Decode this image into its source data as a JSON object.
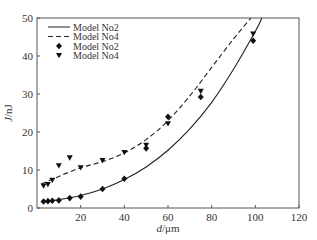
{
  "chart_data": {
    "type": "line",
    "title": "",
    "xlabel": "d/μm",
    "ylabel": "J/nJ",
    "xlim": [
      0,
      120
    ],
    "ylim": [
      0,
      50
    ],
    "xticks": [
      20,
      40,
      60,
      80,
      100,
      120
    ],
    "yticks": [
      0,
      10,
      20,
      30,
      40,
      50
    ],
    "grid": false,
    "legend_position": "upper left",
    "legend": [
      {
        "label": "Model No2",
        "style": "solid-line"
      },
      {
        "label": "Model No4",
        "style": "dashed-line"
      },
      {
        "label": "Model No2",
        "style": "diamond-marker"
      },
      {
        "label": "Model No4",
        "style": "triangle-down-marker"
      }
    ],
    "series": [
      {
        "name": "Model No2 (fit)",
        "kind": "line",
        "style": "solid",
        "x": [
          2,
          10,
          20,
          30,
          40,
          50,
          60,
          70,
          80,
          90,
          100,
          103
        ],
        "y": [
          1.6,
          2.2,
          3.3,
          5.0,
          7.5,
          10.8,
          15.2,
          20.8,
          27.8,
          36.5,
          46.5,
          50
        ]
      },
      {
        "name": "Model No4 (fit)",
        "kind": "line",
        "style": "dashed",
        "x": [
          2,
          10,
          20,
          30,
          40,
          50,
          60,
          70,
          80,
          90,
          98
        ],
        "y": [
          6.3,
          8.3,
          10.6,
          12.2,
          14.5,
          18.0,
          23.0,
          29.5,
          37.0,
          44.5,
          50
        ]
      },
      {
        "name": "Model No2 (data)",
        "kind": "scatter",
        "marker": "diamond",
        "x": [
          3,
          5,
          7,
          10,
          15,
          20,
          30,
          40,
          50,
          60,
          75,
          99
        ],
        "y": [
          1.7,
          1.8,
          1.9,
          2.0,
          2.6,
          3.0,
          5.0,
          7.7,
          15.7,
          24.0,
          29.2,
          44.0
        ]
      },
      {
        "name": "Model No4 (data)",
        "kind": "scatter",
        "marker": "triangle-down",
        "x": [
          3,
          5,
          7,
          10,
          15,
          20,
          30,
          40,
          50,
          60,
          75,
          99
        ],
        "y": [
          5.8,
          6.2,
          7.3,
          11.1,
          13.2,
          10.6,
          12.5,
          14.6,
          16.5,
          22.2,
          30.7,
          45.8
        ]
      }
    ]
  }
}
